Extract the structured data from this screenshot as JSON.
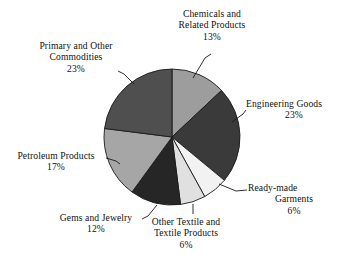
{
  "chart_data": {
    "type": "pie",
    "title": "",
    "subtitle": "",
    "xlabel": "",
    "ylabel": "",
    "legend_position": "none",
    "grid": false,
    "start_angle_deg": 0,
    "direction": "clockwise",
    "categories": [
      "Chemicals and Related Products",
      "Engineering Goods",
      "Ready-made Garments",
      "Other Textile and Textile Products",
      "Gems and Jewelry",
      "Petroleum Products",
      "Primary and Other Commodities"
    ],
    "values": [
      13,
      23,
      6,
      6,
      12,
      17,
      23
    ],
    "value_suffix": "%",
    "slice_colors": [
      "#9d9d9d",
      "#3a3a3a",
      "#f2f2f2",
      "#e0e0e0",
      "#262626",
      "#a6a6a6",
      "#4f4f4f"
    ],
    "slices": [
      {
        "name": "Chemicals and Related Products",
        "value": 13,
        "value_label": "13%",
        "color": "#9d9d9d"
      },
      {
        "name": "Engineering Goods",
        "value": 23,
        "value_label": "23%",
        "color": "#3a3a3a"
      },
      {
        "name": "Ready-made Garments",
        "value": 6,
        "value_label": "6%",
        "color": "#f2f2f2"
      },
      {
        "name": "Other Textile and Textile Products",
        "value": 6,
        "value_label": "6%",
        "color": "#e0e0e0"
      },
      {
        "name": "Gems and Jewelry",
        "value": 12,
        "value_label": "12%",
        "color": "#262626"
      },
      {
        "name": "Petroleum Products",
        "value": 17,
        "value_label": "17%",
        "color": "#a6a6a6"
      },
      {
        "name": "Primary and Other Commodities",
        "value": 23,
        "value_label": "23%",
        "color": "#4f4f4f"
      }
    ]
  },
  "labels": {
    "chemicals": {
      "line1": "Chemicals and",
      "line2": "Related Products",
      "percent": "13%"
    },
    "engineering": {
      "line1": "Engineering Goods",
      "percent": "23%"
    },
    "readymade": {
      "line1": "Ready-made",
      "line2": "Garments",
      "percent": "6%"
    },
    "othertextile": {
      "line1": "Other Textile and",
      "line2": "Textile Products",
      "percent": "6%"
    },
    "gems": {
      "line1": "Gems and Jewelry",
      "percent": "12%"
    },
    "petroleum": {
      "line1": "Petroleum Products",
      "percent": "17%"
    },
    "primary": {
      "line1": "Primary and Other",
      "line2": "Commodities",
      "percent": "23%"
    }
  },
  "style": {
    "background": "#ffffff",
    "text_color": "#111111",
    "slice_outline": "#1a1a1a",
    "leader_line_color": "#1a1a1a"
  }
}
